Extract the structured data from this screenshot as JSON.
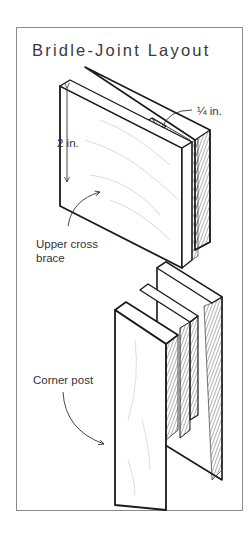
{
  "diagram": {
    "title": "Bridle-Joint Layout",
    "labels": {
      "slot_width": "¼ in.",
      "brace_height": "2 in.",
      "upper_brace_line1": "Upper cross",
      "upper_brace_line2": "brace",
      "corner_post": "Corner post"
    },
    "parts": [
      "upper-cross-brace",
      "corner-post"
    ],
    "colors": {
      "ink": "#1a1a1a",
      "frame": "#8a8a8a",
      "hatch": "#555555",
      "grain": "#cfcfcf"
    }
  }
}
